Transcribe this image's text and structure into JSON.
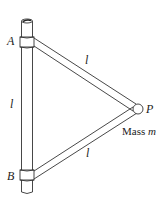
{
  "diagram": {
    "type": "physics-figure",
    "labels": {
      "point_a": "A",
      "point_b": "B",
      "point_p": "P",
      "length_vertical": "l",
      "length_upper_rod": "l",
      "length_lower_rod": "l",
      "mass_prefix": "Mass ",
      "mass_symbol": "m"
    },
    "colors": {
      "stroke": "#333333",
      "background": "#ffffff"
    }
  }
}
